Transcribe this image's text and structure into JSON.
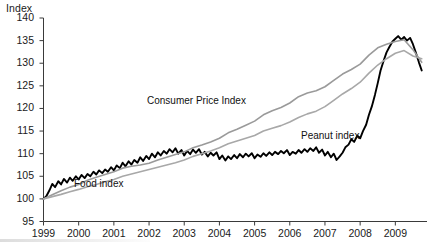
{
  "chart_data": {
    "type": "line",
    "title": "",
    "ylabel": "Index",
    "xlabel": "",
    "ylim": [
      95,
      140
    ],
    "ytick_step": 5,
    "yticks": [
      95,
      100,
      105,
      110,
      115,
      120,
      125,
      130,
      135,
      140
    ],
    "xticks": [
      "1999",
      "2000",
      "2001",
      "2002",
      "2003",
      "2004",
      "2005",
      "2006",
      "2007",
      "2008",
      "2009"
    ],
    "xlim": [
      1999,
      2009.9
    ],
    "grid": false,
    "legend": "inline-annotations",
    "base_index_value": 100,
    "series": [
      {
        "name": "Peanut index",
        "color": "#000000",
        "width": 1.9,
        "style": "noisy",
        "label_x": 2007.15,
        "label_y": 114.0,
        "x": [
          1999.0,
          1999.08,
          1999.17,
          1999.25,
          1999.33,
          1999.42,
          1999.5,
          1999.58,
          1999.67,
          1999.75,
          1999.83,
          1999.92,
          2000.0,
          2000.08,
          2000.17,
          2000.25,
          2000.33,
          2000.42,
          2000.5,
          2000.58,
          2000.67,
          2000.75,
          2000.83,
          2000.92,
          2001.0,
          2001.08,
          2001.17,
          2001.25,
          2001.33,
          2001.42,
          2001.5,
          2001.58,
          2001.67,
          2001.75,
          2001.83,
          2001.92,
          2002.0,
          2002.08,
          2002.17,
          2002.25,
          2002.33,
          2002.42,
          2002.5,
          2002.58,
          2002.67,
          2002.75,
          2002.83,
          2002.92,
          2003.0,
          2003.08,
          2003.17,
          2003.25,
          2003.33,
          2003.42,
          2003.5,
          2003.58,
          2003.67,
          2003.75,
          2003.83,
          2003.92,
          2004.0,
          2004.08,
          2004.17,
          2004.25,
          2004.33,
          2004.42,
          2004.5,
          2004.58,
          2004.67,
          2004.75,
          2004.83,
          2004.92,
          2005.0,
          2005.08,
          2005.17,
          2005.25,
          2005.33,
          2005.42,
          2005.5,
          2005.58,
          2005.67,
          2005.75,
          2005.83,
          2005.92,
          2006.0,
          2006.08,
          2006.17,
          2006.25,
          2006.33,
          2006.42,
          2006.5,
          2006.58,
          2006.67,
          2006.75,
          2006.83,
          2006.92,
          2007.0,
          2007.08,
          2007.17,
          2007.25,
          2007.33,
          2007.42,
          2007.5,
          2007.58,
          2007.67,
          2007.75,
          2007.83,
          2007.92,
          2008.0,
          2008.08,
          2008.17,
          2008.25,
          2008.33,
          2008.42,
          2008.5,
          2008.58,
          2008.67,
          2008.75,
          2008.83,
          2008.92,
          2009.0,
          2009.08,
          2009.17,
          2009.25,
          2009.33,
          2009.42,
          2009.5,
          2009.58,
          2009.67,
          2009.75
        ],
        "y": [
          100.0,
          100.6,
          101.9,
          103.3,
          102.6,
          103.9,
          103.2,
          104.4,
          103.6,
          104.7,
          104.0,
          105.0,
          104.3,
          105.3,
          104.6,
          105.5,
          105.0,
          106.0,
          105.4,
          106.3,
          105.7,
          106.5,
          106.0,
          107.0,
          106.3,
          107.4,
          106.8,
          108.0,
          107.2,
          108.3,
          107.6,
          108.6,
          108.0,
          109.2,
          108.4,
          109.5,
          108.8,
          110.0,
          109.2,
          110.3,
          109.6,
          110.6,
          110.0,
          111.0,
          110.3,
          111.2,
          110.0,
          110.8,
          109.6,
          110.6,
          109.9,
          110.9,
          110.2,
          111.0,
          109.8,
          110.4,
          109.4,
          110.2,
          109.6,
          110.3,
          108.8,
          109.6,
          108.5,
          109.4,
          108.8,
          109.7,
          109.0,
          109.9,
          109.2,
          110.0,
          109.4,
          110.1,
          109.0,
          109.8,
          109.3,
          110.1,
          109.5,
          110.3,
          109.7,
          110.4,
          109.9,
          110.6,
          110.1,
          110.8,
          109.7,
          110.4,
          110.0,
          110.8,
          110.2,
          111.0,
          110.4,
          111.2,
          110.6,
          111.4,
          110.2,
          110.9,
          109.6,
          110.4,
          109.2,
          110.0,
          108.6,
          109.4,
          110.2,
          111.4,
          112.0,
          113.2,
          112.6,
          114.0,
          113.4,
          115.0,
          116.4,
          118.6,
          120.4,
          123.0,
          125.6,
          128.4,
          130.6,
          132.4,
          133.6,
          134.8,
          135.4,
          136.0,
          135.2,
          135.8,
          135.0,
          135.6,
          134.2,
          132.4,
          130.2,
          128.4
        ]
      },
      {
        "name": "Consumer Price Index",
        "color": "#9a9a9a",
        "width": 1.6,
        "style": "smooth",
        "label_x": 2003.35,
        "label_y": 121.6,
        "x": [
          1999.0,
          1999.25,
          1999.5,
          1999.75,
          2000.0,
          2000.25,
          2000.5,
          2000.75,
          2001.0,
          2001.25,
          2001.5,
          2001.75,
          2002.0,
          2002.25,
          2002.5,
          2002.75,
          2003.0,
          2003.25,
          2003.5,
          2003.75,
          2004.0,
          2004.25,
          2004.5,
          2004.75,
          2005.0,
          2005.25,
          2005.5,
          2005.75,
          2006.0,
          2006.25,
          2006.5,
          2006.75,
          2007.0,
          2007.25,
          2007.5,
          2007.75,
          2008.0,
          2008.25,
          2008.5,
          2008.75,
          2009.0,
          2009.25,
          2009.5,
          2009.75
        ],
        "y": [
          100.0,
          100.9,
          101.8,
          102.6,
          103.2,
          104.1,
          104.8,
          105.4,
          106.0,
          106.8,
          107.2,
          107.5,
          107.9,
          108.6,
          109.2,
          109.8,
          110.4,
          111.3,
          111.9,
          112.6,
          113.4,
          114.6,
          115.4,
          116.3,
          117.2,
          118.6,
          119.5,
          120.2,
          121.2,
          122.6,
          123.4,
          123.9,
          124.8,
          126.2,
          127.6,
          128.6,
          129.8,
          131.8,
          133.4,
          134.2,
          134.8,
          135.2,
          133.0,
          130.2
        ]
      },
      {
        "name": "Food index",
        "color": "#a8a8a8",
        "width": 1.6,
        "style": "smooth",
        "label_x": 2000.55,
        "label_y": 103.3,
        "x": [
          1999.0,
          1999.25,
          1999.5,
          1999.75,
          2000.0,
          2000.25,
          2000.5,
          2000.75,
          2001.0,
          2001.25,
          2001.5,
          2001.75,
          2002.0,
          2002.25,
          2002.5,
          2002.75,
          2003.0,
          2003.25,
          2003.5,
          2003.75,
          2004.0,
          2004.25,
          2004.5,
          2004.75,
          2005.0,
          2005.25,
          2005.5,
          2005.75,
          2006.0,
          2006.25,
          2006.5,
          2006.75,
          2007.0,
          2007.25,
          2007.5,
          2007.75,
          2008.0,
          2008.25,
          2008.5,
          2008.75,
          2009.0,
          2009.25,
          2009.5,
          2009.75
        ],
        "y": [
          100.0,
          100.5,
          101.0,
          101.6,
          102.1,
          102.7,
          103.2,
          103.8,
          104.3,
          105.0,
          105.5,
          106.0,
          106.5,
          107.0,
          107.5,
          108.0,
          108.6,
          109.4,
          110.0,
          110.6,
          111.3,
          112.2,
          112.8,
          113.4,
          114.0,
          115.0,
          115.6,
          116.2,
          117.0,
          118.0,
          118.8,
          119.4,
          120.4,
          121.8,
          123.2,
          124.4,
          125.8,
          127.8,
          129.6,
          131.0,
          132.2,
          132.8,
          131.6,
          131.0
        ]
      }
    ]
  },
  "axes": {
    "y_title": "Index",
    "y_labels": [
      "140",
      "135",
      "130",
      "125",
      "120",
      "115",
      "110",
      "105",
      "100",
      "95"
    ],
    "x_labels": [
      "1999",
      "2000",
      "2001",
      "2002",
      "2003",
      "2004",
      "2005",
      "2006",
      "2007",
      "2008",
      "2009"
    ]
  },
  "annotations": {
    "cpi_label": "Consumer Price Index",
    "food_label": "Food index",
    "peanut_label": "Peanut index"
  }
}
